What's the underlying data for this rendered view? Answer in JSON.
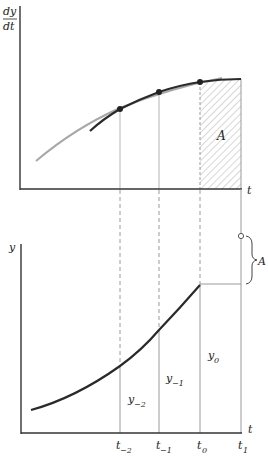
{
  "upper_panel": {
    "y_axis_label_num": "dy",
    "y_axis_label_den": "dt",
    "x_axis_label": "t",
    "area_label": "A"
  },
  "lower_panel": {
    "y_axis_label": "y",
    "x_axis_label": "t",
    "brace_label": "A",
    "ordinate_labels": [
      {
        "base": "y",
        "sub": "−2"
      },
      {
        "base": "y",
        "sub": "−1"
      },
      {
        "base": "y",
        "sub": "0"
      }
    ],
    "tick_labels": [
      {
        "base": "t",
        "sub": "−2"
      },
      {
        "base": "t",
        "sub": "−1"
      },
      {
        "base": "t",
        "sub": "0"
      },
      {
        "base": "t",
        "sub": "1"
      }
    ]
  },
  "colors": {
    "axis": "#333333",
    "curve_dark": "#2a2a2a",
    "curve_gray": "#a8a8a8",
    "guide": "#9a9a9a",
    "hatch": "#b0b0b0"
  }
}
